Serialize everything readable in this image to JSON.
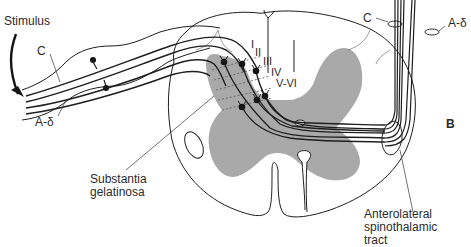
{
  "figure": {
    "panel_label": "B"
  },
  "labels": {
    "stimulus": "Stimulus",
    "c_fiber_left": "C",
    "a_delta_left": "A-δ",
    "c_fiber_right": "C",
    "a_delta_right": "A-δ",
    "substantia_line1": "Substantia",
    "substantia_line2": "gelatinosa",
    "anterolateral_line1": "Anterolateral",
    "anterolateral_line2": "spinothalamic",
    "anterolateral_line3": "tract"
  },
  "laminae": {
    "l1": "I",
    "l2": "II",
    "l3": "III",
    "l4": "IV",
    "l5": "V-VI"
  },
  "colors": {
    "gray_matter": "#a9a9a9",
    "line": "#1e1e1e",
    "neuron": "#151515",
    "background": "#ffffff"
  }
}
